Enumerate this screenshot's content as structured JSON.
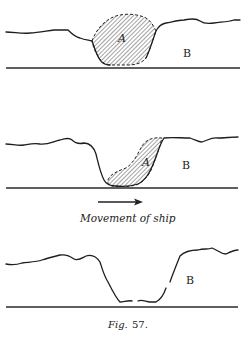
{
  "figure": {
    "caption_prefix": "Fig.",
    "caption_number": "57.",
    "panels": [
      {
        "id": "panel-1",
        "labels": {
          "a": "A",
          "b": "B"
        },
        "description": "Hatched region A sits in a depression in surface B"
      },
      {
        "id": "panel-2",
        "labels": {
          "a": "A",
          "b": "B"
        },
        "description": "Region A displaced toward the right wall of the trough",
        "annotation": "Movement of ship",
        "arrow_direction": "right"
      },
      {
        "id": "panel-3",
        "labels": {
          "b": "B"
        },
        "description": "Trough with region A removed; surface B remains"
      }
    ]
  }
}
